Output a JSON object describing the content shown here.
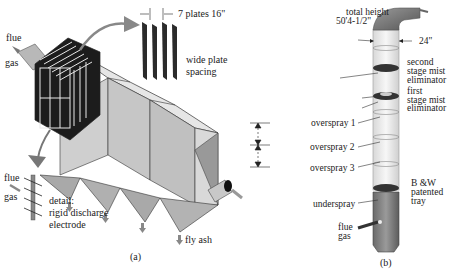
{
  "figure_a": {
    "caption": "(a)",
    "inlet_label_1": "flue",
    "inlet_label_2": "gas",
    "plates_label": "7 plates 16\"",
    "plate_spacing_label_1": "wide plate",
    "plate_spacing_label_2": "spacing",
    "detail_flue_1": "flue",
    "detail_flue_2": "gas",
    "detail_label_1": "detail:",
    "detail_label_2": "rigid discharge",
    "detail_label_3": "electrode",
    "fly_ash_label": "fly ash"
  },
  "figure_b": {
    "caption": "(b)",
    "total_height_1": "total height",
    "total_height_2": "50'4-1/2\"",
    "diameter_label": "24\"",
    "second_stage_1": "second",
    "second_stage_2": "stage mist",
    "second_stage_3": "eliminator",
    "first_stage_1": "first",
    "first_stage_2": "stage mist",
    "first_stage_3": "eliminator",
    "overspray_1": "overspray 1",
    "overspray_2": "overspray 2",
    "overspray_3": "overspray 3",
    "tray_1": "B &W",
    "tray_2": "patented",
    "tray_3": "tray",
    "underspray": "underspray",
    "flue_1": "flue",
    "flue_2": "gas"
  }
}
